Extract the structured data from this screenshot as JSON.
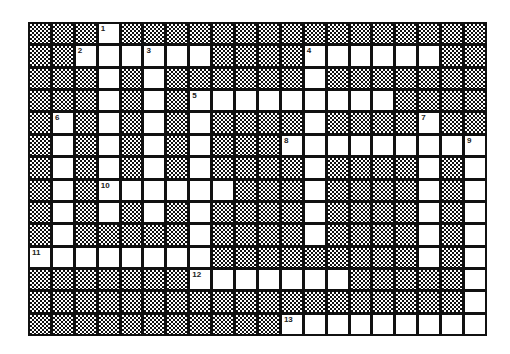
{
  "puzzle": {
    "rows": 14,
    "cols": 20,
    "open_cells": {
      "0": [
        3
      ],
      "1": [
        2,
        3,
        4,
        5,
        6,
        7,
        12,
        13,
        14,
        15,
        16,
        17
      ],
      "2": [
        3,
        5,
        12
      ],
      "3": [
        3,
        5,
        7,
        8,
        9,
        10,
        11,
        12,
        13,
        14,
        15
      ],
      "4": [
        1,
        3,
        5,
        7,
        12,
        17
      ],
      "5": [
        1,
        3,
        5,
        7,
        11,
        12,
        13,
        14,
        15,
        16,
        17,
        18,
        19
      ],
      "6": [
        1,
        3,
        5,
        7,
        12,
        17,
        19
      ],
      "7": [
        1,
        3,
        4,
        5,
        6,
        7,
        8,
        12,
        17,
        19
      ],
      "8": [
        1,
        3,
        5,
        7,
        12,
        17,
        19
      ],
      "9": [
        1,
        7,
        12,
        17,
        19
      ],
      "10": [
        0,
        1,
        2,
        3,
        4,
        5,
        6,
        7,
        17,
        19
      ],
      "11": [
        7,
        8,
        9,
        10,
        11,
        12,
        13,
        19
      ],
      "12": [
        19
      ],
      "13": [
        11,
        12,
        13,
        14,
        15,
        16,
        17,
        18,
        19
      ]
    },
    "clue_numbers": [
      {
        "num": "1",
        "row": 0,
        "col": 3
      },
      {
        "num": "2",
        "row": 1,
        "col": 2
      },
      {
        "num": "3",
        "row": 1,
        "col": 5
      },
      {
        "num": "4",
        "row": 1,
        "col": 12
      },
      {
        "num": "5",
        "row": 3,
        "col": 7
      },
      {
        "num": "6",
        "row": 4,
        "col": 1
      },
      {
        "num": "7",
        "row": 4,
        "col": 17
      },
      {
        "num": "8",
        "row": 5,
        "col": 11
      },
      {
        "num": "9",
        "row": 5,
        "col": 19
      },
      {
        "num": "10",
        "row": 7,
        "col": 3
      },
      {
        "num": "11",
        "row": 10,
        "col": 0
      },
      {
        "num": "12",
        "row": 11,
        "col": 7
      },
      {
        "num": "13",
        "row": 13,
        "col": 11
      }
    ]
  }
}
